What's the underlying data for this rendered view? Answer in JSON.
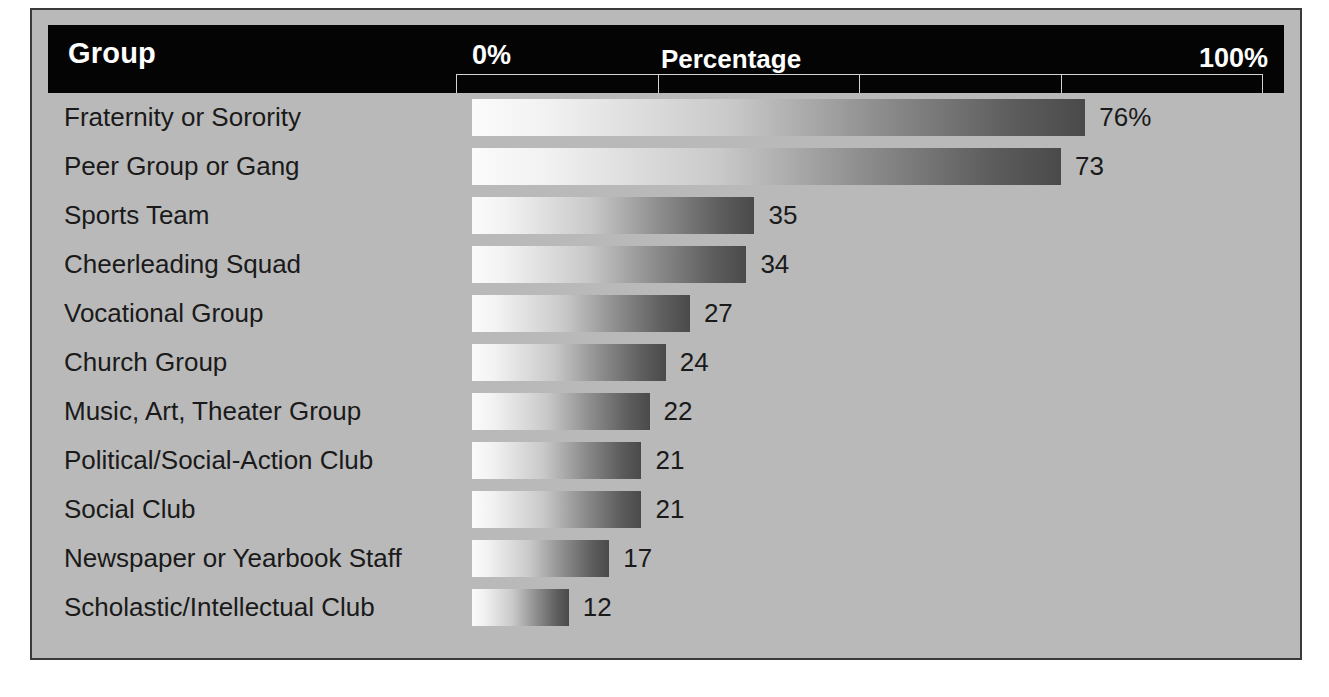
{
  "figure": {
    "column_header": "Group",
    "axis_title": "Percentage",
    "axis_min_label": "0%",
    "axis_max_label": "100%"
  },
  "colors": {
    "panel_background": "#b9b9b9",
    "header_band": "#040404",
    "header_text": "#ffffff",
    "bar_gradient_start": "#fbfbfb",
    "bar_gradient_end": "#4a4a4a",
    "label_text": "#1a1a1a",
    "panel_border": "#3a3a3a",
    "ruler_line": "#d2d2d2"
  },
  "chart_data": {
    "type": "bar",
    "orientation": "horizontal",
    "title": "Percentage",
    "xlabel": "Percentage",
    "ylabel": "Group",
    "xlim": [
      0,
      100
    ],
    "xticks": [
      0,
      25,
      50,
      75,
      100
    ],
    "xtick_labels": [
      "0%",
      "",
      "",
      "",
      "100%"
    ],
    "grid": false,
    "legend": null,
    "value_unit": "percent",
    "categories": [
      "Fraternity or Sorority",
      "Peer Group or Gang",
      "Sports Team",
      "Cheerleading Squad",
      "Vocational Group",
      "Church Group",
      "Music, Art, Theater Group",
      "Political/Social-Action Club",
      "Social Club",
      "Newspaper or Yearbook Staff",
      "Scholastic/Intellectual Club"
    ],
    "values": [
      76,
      73,
      35,
      34,
      27,
      24,
      22,
      21,
      21,
      17,
      12
    ],
    "value_labels": [
      "76%",
      "73",
      "35",
      "34",
      "27",
      "24",
      "22",
      "21",
      "21",
      "17",
      "12"
    ]
  },
  "rows": [
    {
      "label": "Fraternity or Sorority",
      "value": 76,
      "value_label": "76%"
    },
    {
      "label": "Peer Group or Gang",
      "value": 73,
      "value_label": "73"
    },
    {
      "label": "Sports Team",
      "value": 35,
      "value_label": "35"
    },
    {
      "label": "Cheerleading Squad",
      "value": 34,
      "value_label": "34"
    },
    {
      "label": "Vocational Group",
      "value": 27,
      "value_label": "27"
    },
    {
      "label": "Church Group",
      "value": 24,
      "value_label": "24"
    },
    {
      "label": "Music, Art, Theater Group",
      "value": 22,
      "value_label": "22"
    },
    {
      "label": "Political/Social-Action Club",
      "value": 21,
      "value_label": "21"
    },
    {
      "label": "Social Club",
      "value": 21,
      "value_label": "21"
    },
    {
      "label": "Newspaper or Yearbook Staff",
      "value": 17,
      "value_label": "17"
    },
    {
      "label": "Scholastic/Intellectual Club",
      "value": 12,
      "value_label": "12"
    }
  ]
}
